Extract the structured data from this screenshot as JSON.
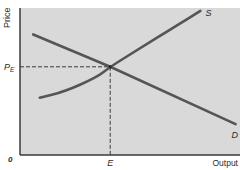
{
  "chart_data": {
    "type": "line",
    "title": "",
    "xlabel": "Output",
    "ylabel": "Price",
    "origin_label": "0",
    "xlim": [
      0,
      10
    ],
    "ylim": [
      0,
      10
    ],
    "grid": false,
    "colors": {
      "plot_bg": "#d9d9d9",
      "axis": "#3a3a3a",
      "curve": "#555555",
      "dash": "#3a3a3a"
    },
    "series": [
      {
        "name": "S",
        "kind": "supply",
        "x": [
          0.9,
          2.0,
          3.5,
          4.1,
          5.5,
          7.0,
          8.2
        ],
        "y": [
          3.9,
          4.3,
          5.3,
          6.0,
          7.3,
          8.7,
          9.8
        ]
      },
      {
        "name": "D",
        "kind": "demand",
        "x": [
          0.6,
          4.1,
          9.8
        ],
        "y": [
          8.2,
          6.0,
          2.1
        ]
      }
    ],
    "equilibrium": {
      "x": 4.1,
      "y": 6.0,
      "x_label": "E",
      "y_label_main": "P",
      "y_label_sub": "E"
    }
  }
}
